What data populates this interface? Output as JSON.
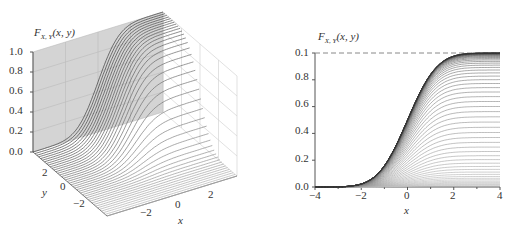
{
  "chart_data": [
    {
      "type": "surface",
      "panel": "left",
      "title": "F_{X,Y}(x, y)",
      "zlabel": "F_{X,Y}(x, y)",
      "xlabel": "x",
      "ylabel": "y",
      "z_ticks": [
        "0.0",
        "0.2",
        "0.4",
        "0.6",
        "0.8",
        "1.0"
      ],
      "x_ticks": [
        "-2",
        "0",
        "2"
      ],
      "y_ticks": [
        "2",
        "0",
        "-2"
      ],
      "zlim": [
        0,
        1
      ],
      "xlim": [
        -4,
        4
      ],
      "ylim": [
        -4,
        4
      ],
      "description": "Joint CDF of two standard normals, surface drawn as curves of constant y; approaches 1.0 as x,y increase",
      "grid": true
    },
    {
      "type": "line",
      "panel": "right",
      "title": "F_{X,Y}(x, y)",
      "xlabel": "x",
      "ylabel": "",
      "y_ticks": [
        "0.0",
        "0.2",
        "0.4",
        "0.6",
        "0.8",
        "0.1"
      ],
      "x_ticks": [
        "-4",
        "-2",
        "0",
        "2",
        "4"
      ],
      "xlim": [
        -4,
        4
      ],
      "ylim": [
        0,
        1
      ],
      "reference_line": {
        "y": 1.0,
        "style": "dashed"
      },
      "description": "Family of curves F(x,y)=Phi(x)*Phi(y) for many y values; each curve saturates at Phi(y)",
      "series_count": 60
    }
  ],
  "left": {
    "zlabel_main": "F",
    "zlabel_sub": "X, Y",
    "zlabel_args": "(x, y)",
    "z_ticks": [
      "1.0",
      "0.8",
      "0.6",
      "0.4",
      "0.2",
      "0.0"
    ],
    "y_ticks": [
      "2",
      "0",
      "−2"
    ],
    "x_ticks": [
      "−2",
      "0",
      "2"
    ],
    "xlabel": "x",
    "ylabel": "y"
  },
  "right": {
    "ylabel_main": "F",
    "ylabel_sub": "X, Y",
    "ylabel_args": "(x, y)",
    "y_ticks": [
      "0.1",
      "0.8",
      "0.6",
      "0.4",
      "0.2",
      "0.0"
    ],
    "x_ticks": [
      "−4",
      "−2",
      "0",
      "2",
      "4"
    ],
    "xlabel": "x"
  }
}
